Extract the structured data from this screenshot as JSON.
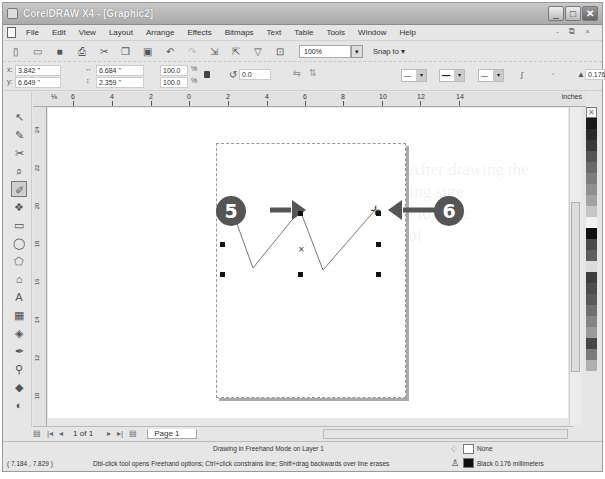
{
  "window": {
    "title": "CorelDRAW X4 - [Graphic2]",
    "controls": [
      "minimize",
      "maximize",
      "close"
    ],
    "mdi_controls": "- ⧉ ×"
  },
  "menu": [
    "File",
    "Edit",
    "View",
    "Layout",
    "Arrange",
    "Effects",
    "Bitmaps",
    "Text",
    "Table",
    "Tools",
    "Window",
    "Help"
  ],
  "toolbar": {
    "icons": [
      "new-icon",
      "open-icon",
      "save-icon",
      "print-icon",
      "cut-icon",
      "copy-icon",
      "paste-icon",
      "undo-icon",
      "redo-icon",
      "import-icon",
      "export-icon",
      "app-launcher-icon",
      "welcome-icon"
    ],
    "zoom_level": "100%",
    "snap_to": "Snap to",
    "snap_arrow": "▾"
  },
  "property_bar": {
    "x_label": "x:",
    "x_value": "3.842 \"",
    "y_label": "y:",
    "y_value": "6.649 \"",
    "width_value": "6.684 \"",
    "height_value": "2.359 \"",
    "scale_x": "100.0",
    "scale_y": "100.0",
    "percent": "%",
    "rotation": "0.0",
    "outline_width": "0.176"
  },
  "ruler": {
    "horizontal_ticks": [
      "6",
      "4",
      "2",
      "0",
      "2",
      "4",
      "6",
      "8",
      "10",
      "12",
      "14"
    ],
    "units": "inches",
    "vertical_ticks": [
      "24",
      "22",
      "20",
      "18",
      "16",
      "14",
      "12",
      "10"
    ]
  },
  "callouts": [
    {
      "label": "5"
    },
    {
      "label": "6"
    }
  ],
  "page_nav": {
    "position": "1 of 1",
    "tab": "Page 1"
  },
  "status": {
    "coordinates": "( 7.184 , 7.829 )",
    "mode": "Drawing in Freehand Mode on Layer 1",
    "hint": "Dbl-click tool opens Freehand options; Ctrl+click constrains line; Shift+drag backwards over line erases",
    "fill": "None",
    "outline": "Black  0.176 millimeters"
  },
  "palette": [
    "#1a1a1a",
    "#2b2b2b",
    "#3a3a3a",
    "#555555",
    "#6a6a6a",
    "#7d7d7d",
    "#8f8f8f",
    "#a3a3a3",
    "#c6c6c6",
    "#f2f2f2",
    "#111111",
    "#4a4a4a",
    "#5e5e5e",
    "#dcdcdc",
    "#3e3e3e",
    "#4c4c4c",
    "#5a5a5a",
    "#6f6f6f",
    "#858585",
    "#9a9a9a",
    "#474747",
    "#7b7b7b",
    "#b0b0b0"
  ],
  "colors": {
    "callout_bg": "#555555",
    "titlebar": "#b5b5b5"
  }
}
